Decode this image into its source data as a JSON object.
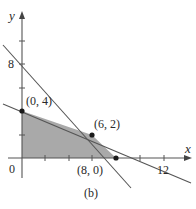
{
  "figure": {
    "caption": "(b)",
    "x_axis_label": "x",
    "y_axis_label": "y",
    "origin_label": "0",
    "x_tick_label": "12",
    "y_tick_label": "8",
    "region_fill": "#a9a9a9",
    "line_color": "#555555",
    "axis_color": "#555555",
    "point_color": "#1a1a1a"
  },
  "points": [
    {
      "label": "(0, 4)",
      "x": 0,
      "y": 4
    },
    {
      "label": "(6, 2)",
      "x": 6,
      "y": 2
    },
    {
      "label": "(8, 0)",
      "x": 8,
      "y": 0
    }
  ],
  "lines": [
    {
      "name": "x + y = 8",
      "p1": [
        0,
        8
      ],
      "p2": [
        8,
        0
      ]
    },
    {
      "name": "x + 3y = 12",
      "p1": [
        0,
        4
      ],
      "p2": [
        12,
        0
      ]
    }
  ],
  "feasible_region": {
    "vertices": [
      [
        0,
        0
      ],
      [
        0,
        4
      ],
      [
        6,
        2
      ],
      [
        8,
        0
      ]
    ]
  },
  "ticks": {
    "x": [
      2,
      4,
      6,
      8,
      10,
      12
    ],
    "y": [
      2,
      4,
      6,
      8,
      10
    ]
  }
}
